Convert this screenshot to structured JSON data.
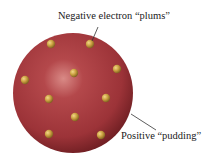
{
  "diagram": {
    "labels": {
      "electrons": "Negative electron “plums”",
      "pudding": "Positive “pudding”"
    },
    "sphere": {
      "cx": 73,
      "cy": 93,
      "r": 60,
      "color": "#a5393d",
      "highlight": "#d98a86",
      "shadow": "#6e1e22"
    },
    "electron_color": "#c9a040",
    "electrons": [
      {
        "x": 51,
        "y": 44
      },
      {
        "x": 90,
        "y": 44
      },
      {
        "x": 74,
        "y": 73
      },
      {
        "x": 117,
        "y": 69
      },
      {
        "x": 25,
        "y": 80
      },
      {
        "x": 49,
        "y": 99
      },
      {
        "x": 106,
        "y": 98
      },
      {
        "x": 75,
        "y": 117
      },
      {
        "x": 49,
        "y": 134
      },
      {
        "x": 101,
        "y": 135
      }
    ]
  }
}
